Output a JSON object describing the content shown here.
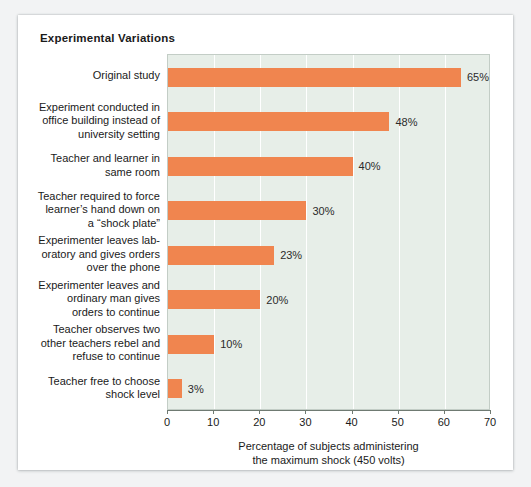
{
  "chart_title": "Experimental Variations",
  "chart_data": {
    "type": "bar",
    "orientation": "horizontal",
    "title": "Experimental Variations",
    "xlabel": "Percentage of subjects administering the maximum shock (450 volts)",
    "ylabel": "",
    "xlim": [
      0,
      70
    ],
    "xticks": [
      0,
      10,
      20,
      30,
      40,
      50,
      60,
      70
    ],
    "xtick_labels": [
      "0",
      "10",
      "20",
      "30",
      "40",
      "50",
      "60",
      "70"
    ],
    "grid": true,
    "legend": false,
    "bar_color": "#f0854f",
    "plot_background": "#e7eee8",
    "categories": [
      "Original study",
      "Experiment conducted in office building instead of university setting",
      "Teacher and learner in same room",
      "Teacher required to force learner's hand down on a “shock plate”",
      "Experimenter leaves lab-oratory and gives orders over the phone",
      "Experimenter leaves and ordinary man gives orders to continue",
      "Teacher observes two other teachers rebel and refuse to continue",
      "Teacher free to choose shock level"
    ],
    "values": [
      65,
      48,
      40,
      30,
      23,
      20,
      10,
      3
    ],
    "value_labels": [
      "65%",
      "48%",
      "40%",
      "30%",
      "23%",
      "20%",
      "10%",
      "3%"
    ]
  },
  "axis_title_lines": [
    "Percentage of subjects administering",
    "the maximum shock (450 volts)"
  ],
  "category_label_lines": [
    [
      "Original study"
    ],
    [
      "Experiment conducted in",
      "office building instead of",
      "university setting"
    ],
    [
      "Teacher and learner in",
      "same room"
    ],
    [
      "Teacher required to force",
      "learner’s hand down on",
      "a “shock plate”"
    ],
    [
      "Experimenter leaves lab-",
      "oratory and gives orders",
      "over the phone"
    ],
    [
      "Experimenter leaves and",
      "ordinary man gives",
      "orders to continue"
    ],
    [
      "Teacher observes two",
      "other teachers rebel and",
      "refuse to continue"
    ],
    [
      "Teacher free to choose",
      "shock level"
    ]
  ]
}
